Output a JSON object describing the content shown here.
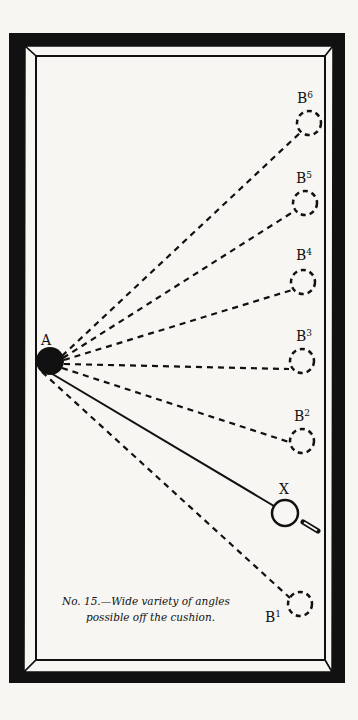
{
  "figure": {
    "caption_line1": "No. 15.—Wide variety of angles",
    "caption_line2": "possible off the cushion.",
    "ball_a_label": "A",
    "object_ball_label": "X",
    "targets": [
      {
        "id": "B1",
        "letter": "B",
        "sup": "1"
      },
      {
        "id": "B2",
        "letter": "B",
        "sup": "2"
      },
      {
        "id": "B3",
        "letter": "B",
        "sup": "3"
      },
      {
        "id": "B4",
        "letter": "B",
        "sup": "4"
      },
      {
        "id": "B5",
        "letter": "B",
        "sup": "5"
      },
      {
        "id": "B6",
        "letter": "B",
        "sup": "6"
      }
    ],
    "colors": {
      "ink": "#111111",
      "paper": "#f7f6f3"
    }
  }
}
